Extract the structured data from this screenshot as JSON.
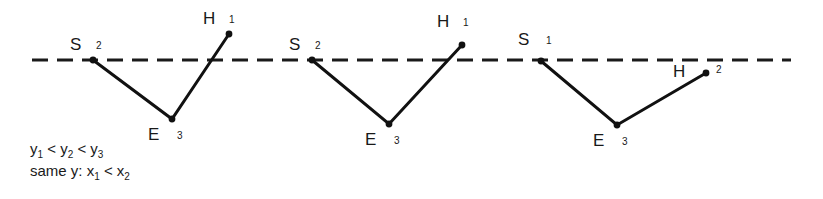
{
  "figure": {
    "kind": "line-diagram",
    "caption_lines": [
      "y1< y2< y3",
      "same y: x1< x2"
    ],
    "constraint_1": {
      "prefix": "",
      "a_var": "y",
      "a_sub": "1",
      "op1": "<",
      "b_var": "y",
      "b_sub": "2",
      "op2": "<",
      "c_var": "y",
      "c_sub": "3"
    },
    "constraint_2": {
      "prefix": "same y:",
      "a_var": "x",
      "a_sub": "1",
      "op1": "<",
      "b_var": "x",
      "b_sub": "2"
    },
    "baseline": {
      "label": "dashed-baseline",
      "y": 60,
      "x_start": 32,
      "x_end": 791,
      "dash": 16,
      "gap": 9,
      "stroke": "#1a1a1a",
      "stroke_width": 3
    },
    "stroke_color": "#111111",
    "dot_color": "#111111",
    "diagrams": [
      {
        "name": "case-1",
        "vertices": [
          {
            "id": "S",
            "label": "S",
            "subscript": "2",
            "x": 93,
            "y": 60,
            "label_x": 70,
            "label_y": 36,
            "sub_x": 96,
            "sub_y": 41,
            "dot": true
          },
          {
            "id": "E",
            "label": "E",
            "subscript": "3",
            "x": 172,
            "y": 119,
            "label_x": 148,
            "label_y": 126,
            "sub_x": 177,
            "sub_y": 131,
            "dot": true
          },
          {
            "id": "H",
            "label": "H",
            "subscript": "1",
            "x": 229,
            "y": 34,
            "label_x": 203,
            "label_y": 10,
            "sub_x": 229,
            "sub_y": 15,
            "dot": true
          }
        ],
        "path": "S-E-H"
      },
      {
        "name": "case-2",
        "vertices": [
          {
            "id": "S",
            "label": "S",
            "subscript": "2",
            "x": 312,
            "y": 60,
            "label_x": 289,
            "label_y": 36,
            "sub_x": 315,
            "sub_y": 41,
            "dot": true
          },
          {
            "id": "E",
            "label": "E",
            "subscript": "3",
            "x": 389,
            "y": 124,
            "label_x": 365,
            "label_y": 131,
            "sub_x": 394,
            "sub_y": 136,
            "dot": true
          },
          {
            "id": "H",
            "label": "H",
            "subscript": "1",
            "x": 462,
            "y": 45,
            "label_x": 437,
            "label_y": 13,
            "sub_x": 463,
            "sub_y": 18,
            "dot": true
          }
        ],
        "path": "S-E-H"
      },
      {
        "name": "case-3",
        "vertices": [
          {
            "id": "S",
            "label": "S",
            "subscript": "1",
            "x": 541,
            "y": 61,
            "label_x": 518,
            "label_y": 31,
            "sub_x": 546,
            "sub_y": 36,
            "dot": true
          },
          {
            "id": "E",
            "label": "E",
            "subscript": "3",
            "x": 617,
            "y": 125,
            "label_x": 593,
            "label_y": 132,
            "sub_x": 622,
            "sub_y": 137,
            "dot": true
          },
          {
            "id": "H",
            "label": "H",
            "subscript": "2",
            "x": 706,
            "y": 73,
            "label_x": 673,
            "label_y": 63,
            "sub_x": 716,
            "sub_y": 65,
            "dot": true
          }
        ],
        "path": "S-E-H"
      }
    ]
  }
}
